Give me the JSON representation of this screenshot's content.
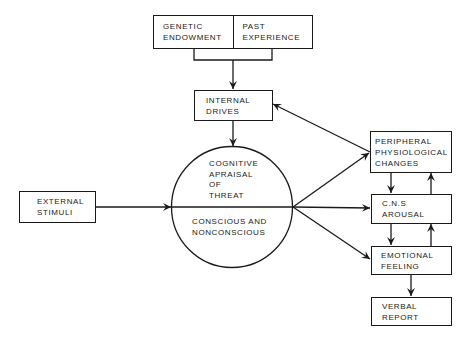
{
  "diagram": {
    "nodes": {
      "genetic_endowment": "GENETIC\nENDOWMENT",
      "past_experience": "PAST\nEXPERIENCE",
      "internal_drives": "INTERNAL\nDRIVES",
      "external_stimuli": "EXTERNAL\nSTIMULI",
      "cognitive_appraisal": "COGNITIVE\nAPRAISAL\nOF\nTHREAT",
      "conscious_nonconscious": "CONSCIOUS  AND\nNONCONSCIOUS",
      "peripheral_changes": "PERIPHERAL\nPHYSIOLOGICAL\nCHANGES",
      "cns_arousal": "C.N.S\nAROUSAL",
      "emotional_feeling": "EMOTIONAL\nFEELING",
      "verbal_report": "VERBAL\nREPORT"
    },
    "edges": [
      {
        "from": "genetic_endowment+past_experience",
        "to": "internal_drives"
      },
      {
        "from": "internal_drives",
        "to": "cognitive_appraisal"
      },
      {
        "from": "external_stimuli",
        "to": "cognitive_appraisal"
      },
      {
        "from": "cognitive_appraisal",
        "to": "peripheral_changes"
      },
      {
        "from": "cognitive_appraisal",
        "to": "cns_arousal"
      },
      {
        "from": "cognitive_appraisal",
        "to": "emotional_feeling"
      },
      {
        "from": "peripheral_changes",
        "to": "internal_drives"
      },
      {
        "from": "peripheral_changes",
        "to": "cns_arousal"
      },
      {
        "from": "cns_arousal",
        "to": "peripheral_changes"
      },
      {
        "from": "cns_arousal",
        "to": "emotional_feeling"
      },
      {
        "from": "emotional_feeling",
        "to": "cns_arousal"
      },
      {
        "from": "emotional_feeling",
        "to": "verbal_report"
      }
    ],
    "colors": {
      "ink": "#1a1a1a",
      "background": "#ffffff"
    }
  }
}
